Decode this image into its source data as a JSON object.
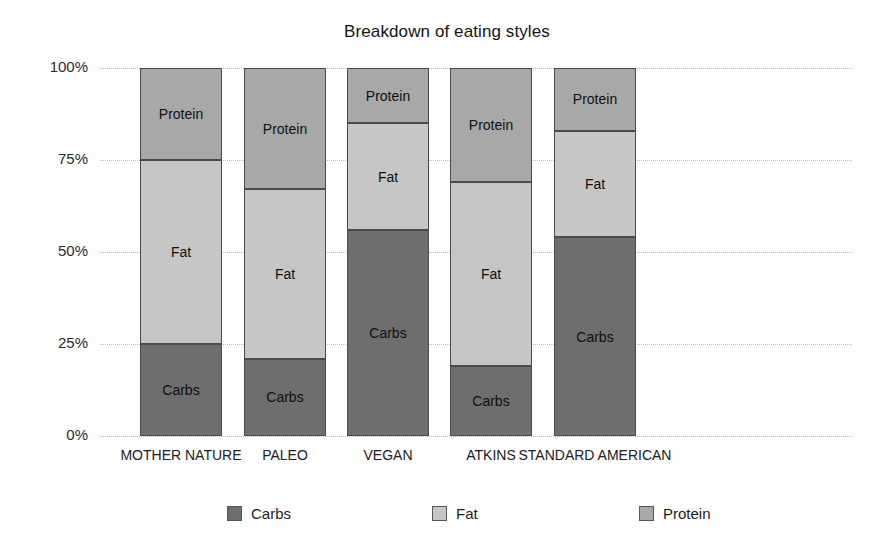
{
  "chart_data": {
    "type": "bar",
    "subtype": "stacked-percentage-column",
    "title": "Breakdown of eating styles",
    "xlabel": "",
    "ylabel": "",
    "ylim": [
      0,
      100
    ],
    "yticks": [
      "0%",
      "25%",
      "50%",
      "75%",
      "100%"
    ],
    "ytick_values": [
      0,
      25,
      50,
      75,
      100
    ],
    "grid": true,
    "legend_position": "bottom",
    "categories": [
      "MOTHER NATURE",
      "PALEO",
      "VEGAN",
      "ATKINS",
      "STANDARD AMERICAN"
    ],
    "series": [
      {
        "name": "Carbs",
        "color": "#6e6e6e",
        "values": [
          25,
          21,
          56,
          19,
          54
        ]
      },
      {
        "name": "Fat",
        "color": "#c6c6c6",
        "values": [
          50,
          45,
          29,
          50,
          29
        ]
      },
      {
        "name": "Protein",
        "color": "#a8a8a8",
        "values": [
          25,
          34,
          15,
          31,
          17
        ]
      }
    ],
    "bar_segment_labels": [
      "Carbs",
      "Fat",
      "Protein"
    ],
    "bars": [
      {
        "category": "MOTHER NATURE",
        "segments": [
          {
            "label": "Carbs",
            "value": 25,
            "start": 0,
            "end": 25
          },
          {
            "label": "Fat",
            "value": 50,
            "start": 25,
            "end": 75
          },
          {
            "label": "Protein",
            "value": 25,
            "start": 75,
            "end": 100
          }
        ]
      },
      {
        "category": "PALEO",
        "segments": [
          {
            "label": "Carbs",
            "value": 21,
            "start": 0,
            "end": 21
          },
          {
            "label": "Fat",
            "value": 46,
            "start": 21,
            "end": 67
          },
          {
            "label": "Protein",
            "value": 33,
            "start": 67,
            "end": 100
          }
        ]
      },
      {
        "category": "VEGAN",
        "segments": [
          {
            "label": "Carbs",
            "value": 56,
            "start": 0,
            "end": 56
          },
          {
            "label": "Fat",
            "value": 29,
            "start": 56,
            "end": 85
          },
          {
            "label": "Protein",
            "value": 15,
            "start": 85,
            "end": 100
          }
        ]
      },
      {
        "category": "ATKINS",
        "segments": [
          {
            "label": "Carbs",
            "value": 19,
            "start": 0,
            "end": 19
          },
          {
            "label": "Fat",
            "value": 50,
            "start": 19,
            "end": 69
          },
          {
            "label": "Protein",
            "value": 31,
            "start": 69,
            "end": 100
          }
        ]
      },
      {
        "category": "STANDARD AMERICAN",
        "segments": [
          {
            "label": "Carbs",
            "value": 54,
            "start": 0,
            "end": 54
          },
          {
            "label": "Fat",
            "value": 29,
            "start": 54,
            "end": 83
          },
          {
            "label": "Protein",
            "value": 17,
            "start": 83,
            "end": 100
          }
        ]
      }
    ],
    "legend": [
      {
        "label": "Carbs",
        "color": "#6e6e6e"
      },
      {
        "label": "Fat",
        "color": "#c6c6c6"
      },
      {
        "label": "Protein",
        "color": "#a8a8a8"
      }
    ]
  },
  "layout": {
    "bar_left_px": [
      40,
      144,
      247,
      350,
      454
    ],
    "bar_width_px": 82,
    "legend_left_px": [
      227,
      432,
      639
    ]
  }
}
